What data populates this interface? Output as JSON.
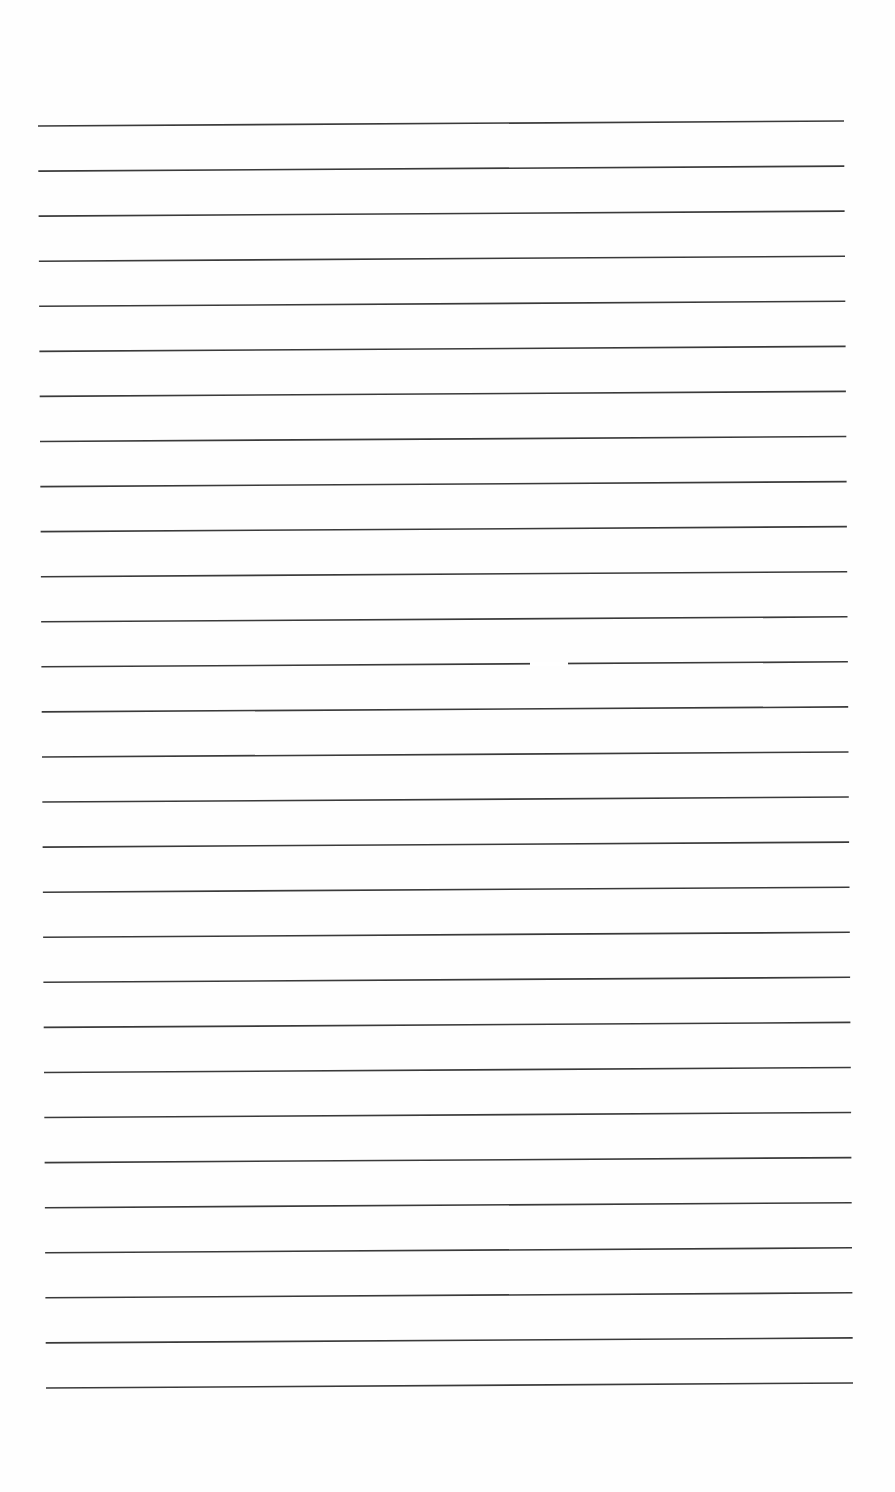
{
  "page": {
    "type": "blank-lined-paper",
    "background_color": "#fefefe",
    "line_color": "#3a3a3a",
    "line_count": 29,
    "text_content": ""
  },
  "lines": {
    "start_y_left": 126,
    "spacing": 45.07,
    "x_left_start": 38,
    "x_left_end": 46,
    "x_right_start": 844,
    "x_right_end": 853,
    "rise_right": 5,
    "break_on_line": 13,
    "break_x": [
      530,
      568
    ]
  }
}
